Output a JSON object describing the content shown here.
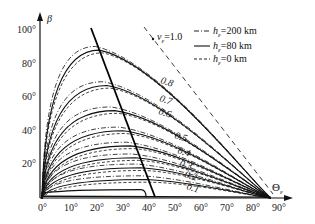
{
  "chart_data": {
    "type": "line",
    "title": "",
    "xlabel": "Θε",
    "ylabel": "β",
    "xlim": [
      0,
      90
    ],
    "ylim": [
      0,
      100
    ],
    "x_ticks": [
      "0°",
      "10°",
      "20°",
      "30°",
      "40°",
      "50°",
      "60°",
      "70°",
      "80°",
      "90°"
    ],
    "y_ticks": [
      "20°",
      "40°",
      "60°",
      "80°",
      "100°"
    ],
    "grid": false,
    "legend": {
      "position": "upper right",
      "entries": [
        {
          "style": "dash-dot",
          "label": "hε=200 km"
        },
        {
          "style": "solid",
          "label": "hε=80 km"
        },
        {
          "style": "dashed",
          "label": "hε=0 km"
        }
      ]
    },
    "annotations": [
      {
        "text": "vε=1.0",
        "x": 44,
        "y": 96
      },
      {
        "text": "locus of maximum β",
        "style": "thick solid line",
        "from": [
          19,
          100
        ],
        "to": [
          43,
          0
        ]
      }
    ],
    "series": [
      {
        "name": "vε=0.8",
        "peak_theta": 22,
        "peak_beta": 88,
        "end_theta": 88
      },
      {
        "name": "vε=0.7",
        "peak_theta": 25,
        "peak_beta": 67,
        "end_theta": 88
      },
      {
        "name": "vε=0.6",
        "peak_theta": 28,
        "peak_beta": 52,
        "end_theta": 88
      },
      {
        "name": "vε=0.5",
        "peak_theta": 31,
        "peak_beta": 40,
        "end_theta": 88
      },
      {
        "name": "vε=0.4",
        "peak_theta": 34,
        "peak_beta": 31,
        "end_theta": 88
      },
      {
        "name": "vε=0.3",
        "peak_theta": 36,
        "peak_beta": 24,
        "end_theta": 88
      },
      {
        "name": "vε=0.2",
        "peak_theta": 38,
        "peak_beta": 18,
        "end_theta": 88
      },
      {
        "name": "vε=0.1",
        "peak_theta": 40,
        "peak_beta": 11,
        "end_theta": 88
      },
      {
        "name": "vε=1.0",
        "peak_theta": 0,
        "peak_beta": 100,
        "end_theta": 88,
        "style": "dashed straight"
      }
    ],
    "curve_labels": [
      "0.8",
      "0.7",
      "0.6",
      "0.5",
      "0.4",
      "0.3",
      "0.2",
      "0.1"
    ]
  },
  "labels": {
    "y_axis": "β",
    "x_axis": "Θ",
    "x_axis_sub": "ε",
    "v_label": "v",
    "v_sub": "ε",
    "v_value": "=1.0",
    "legend_h": "h",
    "legend_sub": "ε",
    "legend_200": "=200 km",
    "legend_80": "=80 km",
    "legend_0": "=0 km"
  }
}
